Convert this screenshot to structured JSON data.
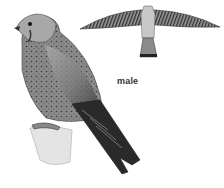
{
  "illustration": {
    "subject": "kestrel",
    "label": "male",
    "figures": [
      "perched-bird",
      "flying-bird"
    ],
    "palette": {
      "background": "#ffffff",
      "dark": "#2a2a2a",
      "mid": "#777777",
      "light": "#bdbdbd"
    }
  }
}
